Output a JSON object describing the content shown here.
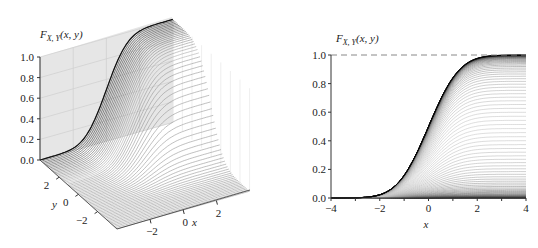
{
  "chart_data": [
    {
      "type": "surface3d",
      "title": "",
      "zlabel": "F_{X,Y}(x, y)",
      "xlabel": "x",
      "ylabel": "y",
      "zlabel_text": "F",
      "zlabel_sub": "X, Y",
      "zlabel_args": "(x, y)",
      "xticks": [
        "−2",
        "0",
        "2"
      ],
      "yticks": [
        "2",
        "0",
        "−2"
      ],
      "zticks": [
        "0.0",
        "0.2",
        "0.4",
        "0.6",
        "0.8",
        "1.0"
      ],
      "xlim": [
        -4,
        4
      ],
      "ylim": [
        -4,
        4
      ],
      "zlim": [
        0,
        1
      ],
      "description": "Joint CDF of two independent standard normals, F(x,y)=Φ(x)Φ(y), drawn as a family of curves in x for many fixed y values",
      "grid": true
    },
    {
      "type": "line",
      "title": "",
      "ylabel": "F_{X,Y}(x, y)",
      "ylabel_text": "F",
      "ylabel_sub": "X, Y",
      "ylabel_args": "(x, y)",
      "xlabel": "x",
      "xticks": [
        "−4",
        "−2",
        "0",
        "2",
        "4"
      ],
      "yticks": [
        "0.0",
        "0.2",
        "0.4",
        "0.6",
        "0.8",
        "1.0"
      ],
      "xlim": [
        -4,
        4
      ],
      "ylim": [
        0,
        1
      ],
      "reference_line": {
        "y": 1.0,
        "style": "dashed",
        "color": "#888888"
      },
      "series_description": "Family of curves F(x,y)=Φ(x)Φ(y) for y from about −3 to 3; each curve saturates at Φ(y)",
      "x": [
        -4,
        -3,
        -2,
        -1,
        0,
        1,
        2,
        3,
        4
      ],
      "series": [
        {
          "name": "y→∞ (envelope)",
          "values": [
            0.0,
            0.001,
            0.023,
            0.159,
            0.5,
            0.841,
            0.977,
            0.999,
            1.0
          ]
        },
        {
          "name": "y=1",
          "values": [
            0.0,
            0.001,
            0.019,
            0.134,
            0.421,
            0.708,
            0.822,
            0.84,
            0.841
          ]
        },
        {
          "name": "y=0",
          "values": [
            0.0,
            0.001,
            0.011,
            0.079,
            0.25,
            0.421,
            0.489,
            0.499,
            0.5
          ]
        },
        {
          "name": "y=-1",
          "values": [
            0.0,
            0.0,
            0.004,
            0.025,
            0.079,
            0.134,
            0.155,
            0.159,
            0.159
          ]
        },
        {
          "name": "y=-3",
          "values": [
            0.0,
            0.0,
            0.0,
            0.0,
            0.001,
            0.001,
            0.001,
            0.001,
            0.001
          ]
        }
      ]
    }
  ]
}
